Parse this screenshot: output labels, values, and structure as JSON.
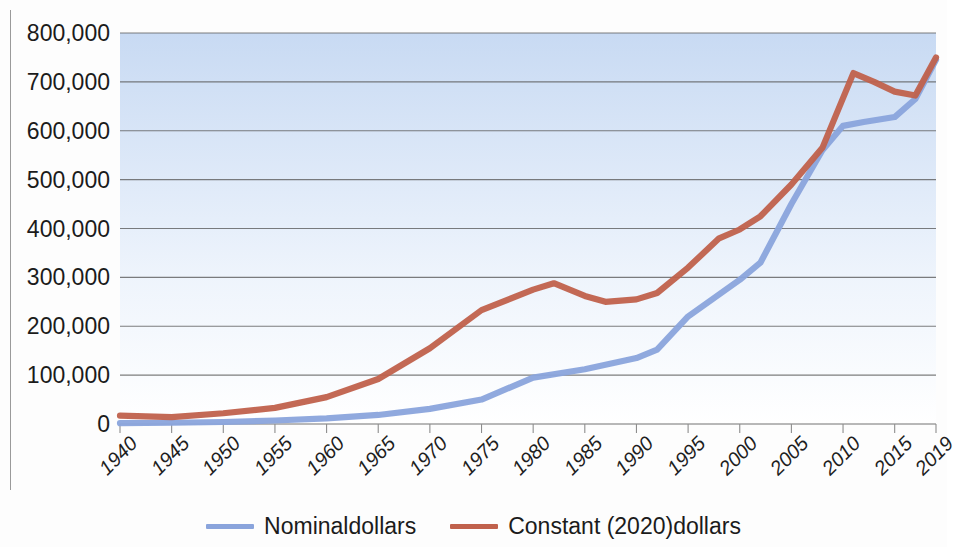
{
  "chart_data": {
    "type": "line",
    "title": "",
    "xlabel": "",
    "ylabel": "",
    "xlim": [
      1940,
      2019
    ],
    "ylim": [
      0,
      800000
    ],
    "y_ticks": [
      0,
      100000,
      200000,
      300000,
      400000,
      500000,
      600000,
      700000,
      800000
    ],
    "y_tick_labels": [
      "0",
      "100,000",
      "200,000",
      "300,000",
      "400,000",
      "500,000",
      "600,000",
      "700,000",
      "800,000"
    ],
    "x_ticks": [
      1940,
      1945,
      1950,
      1955,
      1960,
      1965,
      1970,
      1975,
      1980,
      1985,
      1990,
      1995,
      2000,
      2005,
      2010,
      2015,
      2019
    ],
    "x_tick_labels": [
      "1940",
      "1945",
      "1950",
      "1955",
      "1960",
      "1965",
      "1970",
      "1975",
      "1980",
      "1985",
      "1990",
      "1995",
      "2000",
      "2005",
      "2010",
      "2015",
      "2019"
    ],
    "grid": "horizontal",
    "legend_position": "bottom",
    "series": [
      {
        "name": "Nominaldollars",
        "color": "#8aa4dc",
        "x": [
          1940,
          1945,
          1950,
          1955,
          1960,
          1965,
          1970,
          1975,
          1980,
          1985,
          1990,
          1992,
          1995,
          2000,
          2002,
          2005,
          2008,
          2010,
          2012,
          2015,
          2017,
          2019
        ],
        "values": [
          1800,
          2600,
          4100,
          7200,
          11500,
          18500,
          31000,
          50000,
          95000,
          112000,
          135000,
          152000,
          220000,
          295000,
          330000,
          450000,
          560000,
          610000,
          618000,
          628000,
          665000,
          745000
        ]
      },
      {
        "name": "Constant (2020)dollars",
        "color": "#c0614c",
        "x": [
          1940,
          1945,
          1950,
          1955,
          1960,
          1965,
          1970,
          1975,
          1980,
          1982,
          1985,
          1987,
          1990,
          1992,
          1995,
          1998,
          2000,
          2002,
          2005,
          2008,
          2011,
          2013,
          2015,
          2017,
          2019
        ],
        "values": [
          17000,
          14000,
          22000,
          33000,
          55000,
          92000,
          155000,
          233000,
          275000,
          288000,
          262000,
          250000,
          255000,
          268000,
          320000,
          380000,
          398000,
          425000,
          490000,
          565000,
          718000,
          700000,
          680000,
          672000,
          750000
        ]
      }
    ]
  },
  "legend": {
    "items": [
      {
        "label": "Nominaldollars",
        "color": "#8aa4dc"
      },
      {
        "label": "Constant (2020)dollars",
        "color": "#c0614c"
      }
    ]
  },
  "ghost_text": {
    "line1": "the of underlying the of federal and reasonable",
    "line2": "annual of continued in on the in a",
    "line3": "of the continue the of a the of"
  },
  "colors": {
    "plot_gradient_top": "#c8daf3",
    "plot_gradient_bottom": "#ffffff",
    "gridline": "#5a5a5a",
    "axis": "#9a9a9a",
    "text": "#1b1b1b"
  }
}
